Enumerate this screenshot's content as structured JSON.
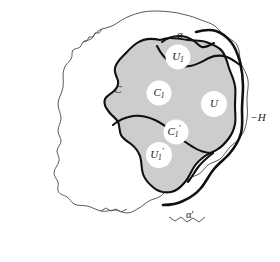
{
  "figure": {
    "kind": "topology-diagram",
    "colors": {
      "background": "#ffffff",
      "shaded_region": "#cdcdcd",
      "thick_boundary": "#101010",
      "thin_boundary": "#5a5a5a",
      "disc_fill": "#ffffff",
      "text": "#1a1a1a"
    },
    "outer_region": {
      "name": "ambient-region",
      "boundary_style": "thin-jagged"
    },
    "shaded_region": {
      "name": "shaded-set",
      "boundary_style": "thick-smooth"
    },
    "discs": [
      {
        "id": "U1",
        "base": "U",
        "sub": "1",
        "prime": "",
        "cx": 178,
        "cy": 57,
        "r": 12.5
      },
      {
        "id": "C1",
        "base": "C",
        "sub": "1",
        "prime": "",
        "cx": 159,
        "cy": 93,
        "r": 12.5
      },
      {
        "id": "U",
        "base": "U",
        "sub": "",
        "prime": "",
        "cx": 214,
        "cy": 104,
        "r": 13.0
      },
      {
        "id": "C1p",
        "base": "C",
        "sub": "1",
        "prime": "′",
        "cx": 176,
        "cy": 132,
        "r": 12.5
      },
      {
        "id": "U1p",
        "base": "U",
        "sub": "1",
        "prime": "′",
        "cx": 159,
        "cy": 155,
        "r": 13.0
      }
    ],
    "outer_labels": [
      {
        "id": "alpha",
        "text": "α",
        "x": 180,
        "y": 36,
        "style": "greek"
      },
      {
        "id": "alpha-prime",
        "text": "α′",
        "x": 190,
        "y": 216,
        "style": "greek"
      },
      {
        "id": "C",
        "text": "C",
        "x": 118,
        "y": 90,
        "style": "italic"
      },
      {
        "id": "minus-H",
        "text": "−H",
        "x": 256,
        "y": 118,
        "style": "italic"
      }
    ],
    "paths": {
      "outer_boundary": "M 187 16 C 170 13 150 12 136 16 C 122 20 112 27 104 32 C 99 35 96 34 93 37 C 90 40 89 44 86 46 C 83 48 80 47 78 49 C 76 51 77 54 75 56 C 73 58 70 57 69 59 C 67 62 69 66 67 70 C 65 75 61 78 60 84 C 59 92 61 100 60 107 C 59 115 56 120 57 127 C 58 134 62 138 62 144 C 62 150 58 153 57 159 C 56 165 58 169 57 174 C 56 179 52 182 52 187 C 52 192 56 194 57 198 C 58 202 56 205 58 208 C 60 211 64 211 67 213 C 70 215 71 218 74 220 C 78 222 83 221 88 222 C 94 223 98 226 104 227 C 110 228 114 226 119 226 C 124 226 127 229 132 229 C 137 229 140 226 144 224 C 148 222 150 219 153 217 C 156 215 159 215 162 213 C 166 211 168 207 172 205 C 176 203 180 204 184 202 C 188 200 190 196 193 194 C 196 192 199 192 202 190 C 205 188 206 185 209 183 C 212 181 216 181 219 179 C 223 177 225 173 229 170 C 233 167 237 166 240 162 C 244 158 245 153 247 148 C 249 142 249 136 250 130 C 251 123 253 118 253 111 C 253 104 251 99 251 93 C 251 86 253 81 252 75 C 251 68 247 64 245 58 C 243 52 244 47 241 43 C 238 39 233 39 229 36 C 225 33 223 29 219 27 C 214 24 209 24 204 22 C 198 20 193 17 187 16 Z",
      "shaded_region": "M 166 38 C 158 36 150 37 144 40 C 138 43 134 48 130 52 C 126 56 122 58 119 62 C 116 66 115 71 113 75 C 111 79 107 81 106 85 C 105 90 108 94 110 98 C 112 102 115 104 116 108 C 117 112 115 116 114 120 C 113 125 113 129 115 133 C 117 137 121 139 125 142 C 129 145 131 149 133 154 C 135 160 134 166 136 172 C 138 178 142 182 147 186 C 152 190 158 192 164 192 C 170 192 175 189 179 185 C 183 181 185 176 188 171 C 191 166 194 163 198 160 C 202 157 207 156 211 154 C 216 152 220 151 224 148 C 229 145 232 141 235 137 C 238 133 240 129 241 124 C 242 118 241 112 241 106 C 241 99 242 93 241 87 C 240 80 237 75 235 69 C 233 63 232 57 228 52 C 224 47 218 45 212 43 C 206 41 200 42 194 41 C 188 40 182 38 176 37 C 173 37 169 38 166 38 Z"
    }
  }
}
